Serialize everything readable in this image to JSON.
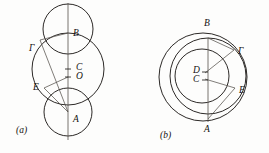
{
  "plate": {
    "kind": "geometry-figure-plate",
    "background_color": "#fdfdfc",
    "ink_color": "#14110f",
    "thin_ink_color": "#56514c",
    "panels": [
      {
        "tag": "(a)",
        "tag_x": 16,
        "tag_y": 126,
        "description": "Three circles on a common vertical axis: a large central circle with a smaller circle above and a smaller circle below; chords drawn from Gamma and E to A and B through the center region.",
        "circles": [
          {
            "name": "upper-circle",
            "cx": 68,
            "cy": 29,
            "r": 25
          },
          {
            "name": "central-circle",
            "cx": 68,
            "cy": 69,
            "r": 36
          },
          {
            "name": "lower-circle",
            "cx": 68,
            "cy": 112,
            "r": 24
          }
        ],
        "axis": {
          "name": "vertical-axis",
          "x": 68,
          "y1": 3,
          "y2": 140
        },
        "segments": [
          {
            "name": "segment-gamma-b",
            "x1": 40,
            "y1": 40,
            "x2": 68,
            "y2": 33
          },
          {
            "name": "segment-gamma-a",
            "x1": 40,
            "y1": 40,
            "x2": 68,
            "y2": 112
          },
          {
            "name": "segment-e-a",
            "x1": 44,
            "y1": 88,
            "x2": 68,
            "y2": 112
          },
          {
            "name": "segment-e-o",
            "x1": 44,
            "y1": 88,
            "x2": 68,
            "y2": 77
          }
        ],
        "tick_marks": [
          {
            "name": "tick-c",
            "x": 68,
            "y": 69
          },
          {
            "name": "tick-o",
            "x": 68,
            "y": 77
          }
        ],
        "points": [
          {
            "label": "B",
            "x": 73,
            "y": 29,
            "anchor": "left"
          },
          {
            "label": "Γ",
            "x": 29,
            "y": 44,
            "anchor": "left"
          },
          {
            "label": "C",
            "x": 76,
            "y": 63,
            "anchor": "left"
          },
          {
            "label": "O",
            "x": 76,
            "y": 72,
            "anchor": "left"
          },
          {
            "label": "E",
            "x": 33,
            "y": 83,
            "anchor": "left"
          },
          {
            "label": "A",
            "x": 73,
            "y": 115,
            "anchor": "left"
          }
        ]
      },
      {
        "tag": "(b)",
        "tag_x": 160,
        "tag_y": 131,
        "description": "Two nested circles sharing a near-common vertical diameter through B and A; centers D and C marked; chords from the centers to Gamma and E, and a chord from A to E.",
        "circles": [
          {
            "name": "outer-circle",
            "cx": 203,
            "cy": 77,
            "r": 44
          },
          {
            "name": "inner-circle",
            "cx": 208,
            "cy": 76,
            "r": 38
          },
          {
            "name": "innermost-circle",
            "cx": 202,
            "cy": 76,
            "r": 27
          }
        ],
        "axis": {
          "name": "vertical-axis",
          "x": 208,
          "y1": 38,
          "y2": 122
        },
        "segments": [
          {
            "name": "segment-d-gamma",
            "x1": 205,
            "y1": 73,
            "x2": 234,
            "y2": 50
          },
          {
            "name": "segment-c-e",
            "x1": 205,
            "y1": 79,
            "x2": 235,
            "y2": 88
          },
          {
            "name": "segment-a-e",
            "x1": 208,
            "y1": 119,
            "x2": 235,
            "y2": 88
          },
          {
            "name": "segment-b-gamma",
            "x1": 208,
            "y1": 38,
            "x2": 234,
            "y2": 50
          }
        ],
        "tick_marks": [
          {
            "name": "tick-d",
            "x": 205,
            "y": 72
          },
          {
            "name": "tick-c",
            "x": 205,
            "y": 80
          }
        ],
        "points": [
          {
            "label": "B",
            "x": 204,
            "y": 19,
            "anchor": "left"
          },
          {
            "label": "Γ",
            "x": 238,
            "y": 47,
            "anchor": "left"
          },
          {
            "label": "D",
            "x": 193,
            "y": 66,
            "anchor": "left"
          },
          {
            "label": "C",
            "x": 193,
            "y": 75,
            "anchor": "left"
          },
          {
            "label": "E",
            "x": 239,
            "y": 86,
            "anchor": "left"
          },
          {
            "label": "A",
            "x": 204,
            "y": 125,
            "anchor": "left"
          }
        ]
      }
    ]
  }
}
